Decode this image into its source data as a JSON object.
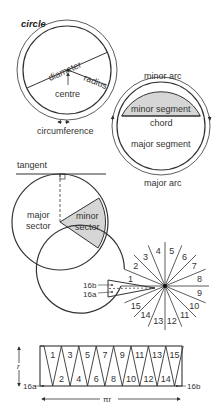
{
  "title": "circle",
  "colors": {
    "line": "#333333",
    "shade": "#d6d6d6",
    "background": "#ffffff"
  },
  "circle_parts": {
    "diameter": "diameter",
    "radius": "radius",
    "centre": "centre",
    "circumference": "circumference"
  },
  "segments": {
    "minor_arc": "minor arc",
    "minor_segment": "minor segment",
    "chord": "chord",
    "major_segment": "major segment",
    "major_arc": "major arc"
  },
  "sectors": {
    "tangent": "tangent",
    "major_sector_line1": "major",
    "major_sector_line2": "sector",
    "minor_sector_line1": "minor",
    "minor_sector_line2": "sector"
  },
  "divided_circle": {
    "numbers": [
      "1",
      "2",
      "3",
      "4",
      "5",
      "6",
      "7",
      "8",
      "9",
      "10",
      "11",
      "12",
      "13",
      "14",
      "15"
    ],
    "label_16b": "16b",
    "label_16a": "16a"
  },
  "rearranged": {
    "top_numbers": [
      "1",
      "3",
      "5",
      "7",
      "9",
      "11",
      "13",
      "15"
    ],
    "bottom_numbers": [
      "2",
      "4",
      "6",
      "8",
      "10",
      "12",
      "14"
    ],
    "height_label": "r",
    "width_label": "πr",
    "label_16a": "16a",
    "label_16b": "16b"
  }
}
